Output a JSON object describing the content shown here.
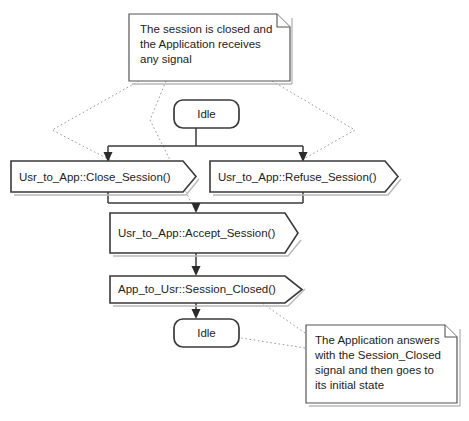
{
  "diagram": {
    "type": "uml-state-signal-flow",
    "background_color": "#ffffff",
    "line_color": "#3a3a3a",
    "anchor_color": "#9a9a9a",
    "text_color": "#1d1d1d"
  },
  "notes": [
    {
      "id": "note-top",
      "name": "note-session-closed-condition",
      "lines": [
        "The session is closed and",
        "the Application receives",
        "any signal"
      ]
    },
    {
      "id": "note-bottom",
      "name": "note-application-answers",
      "lines": [
        "The Application answers",
        "with the Session_Closed",
        "signal and then goes to",
        "its initial state"
      ]
    }
  ],
  "states": [
    {
      "id": "state-idle-top",
      "label": "Idle"
    },
    {
      "id": "state-idle-bottom",
      "label": "Idle"
    }
  ],
  "signals": [
    {
      "id": "signal-close-session",
      "label": "Usr_to_App::Close_Session()",
      "kind": "receive"
    },
    {
      "id": "signal-refuse-session",
      "label": "Usr_to_App::Refuse_Session()",
      "kind": "receive"
    },
    {
      "id": "signal-accept-session",
      "label": "Usr_to_App::Accept_Session()",
      "kind": "receive"
    },
    {
      "id": "signal-session-closed",
      "label": "App_to_Usr::Session_Closed()",
      "kind": "send"
    }
  ]
}
